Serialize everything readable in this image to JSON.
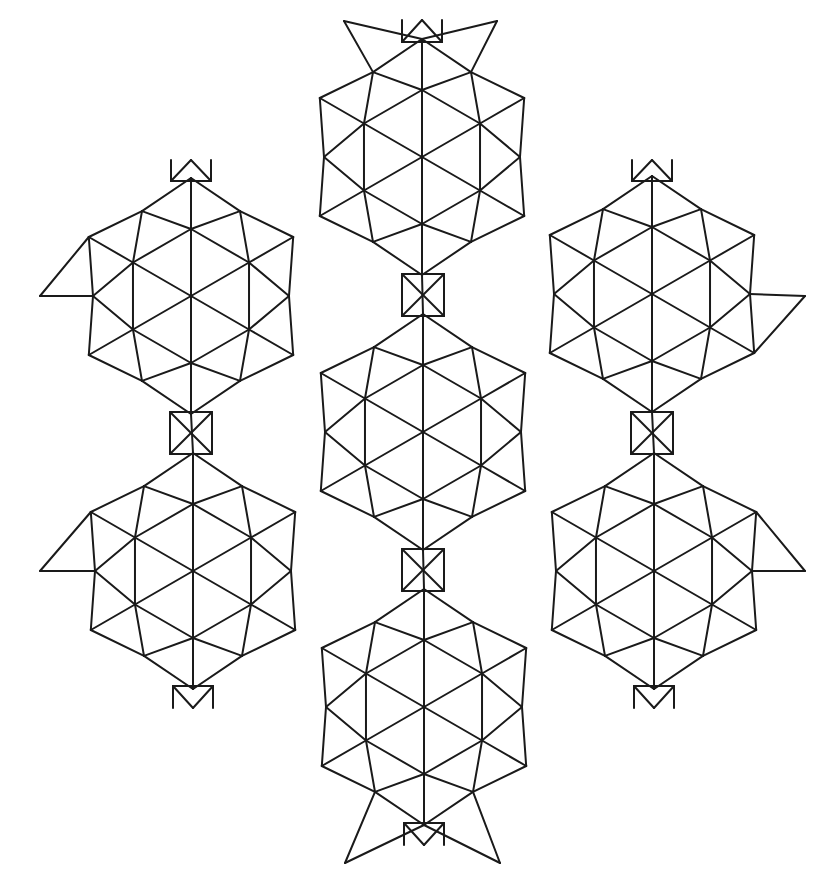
{
  "diagram": {
    "stroke_color": "#1a1a1a",
    "background": "#ffffff",
    "hex_radius": 67,
    "edge_apex_radius": 98,
    "vertex_ext_radius": 118,
    "flowers": [
      {
        "name": "top",
        "cx": 422,
        "cy": 157
      },
      {
        "name": "upper-left",
        "cx": 191,
        "cy": 296
      },
      {
        "name": "upper-right",
        "cx": 652,
        "cy": 294
      },
      {
        "name": "center",
        "cx": 423,
        "cy": 432
      },
      {
        "name": "lower-left",
        "cx": 193,
        "cy": 571
      },
      {
        "name": "lower-right",
        "cx": 654,
        "cy": 571
      },
      {
        "name": "bottom",
        "cx": 424,
        "cy": 707
      }
    ],
    "crossed_squares": [
      {
        "cx": 191,
        "cy": 433,
        "half": 21
      },
      {
        "cx": 423,
        "cy": 295,
        "half": 21
      },
      {
        "cx": 652,
        "cy": 433,
        "half": 21
      },
      {
        "cx": 423,
        "cy": 570,
        "half": 21
      }
    ],
    "outer_tips": [
      {
        "x": 40,
        "y": 296
      },
      {
        "x": 40,
        "y": 571
      },
      {
        "x": 805,
        "y": 296
      },
      {
        "x": 805,
        "y": 571
      },
      {
        "x": 344,
        "y": 21
      },
      {
        "x": 497,
        "y": 21
      },
      {
        "x": 345,
        "y": 863
      },
      {
        "x": 500,
        "y": 863
      }
    ],
    "tabs": [
      {
        "apex_x": 422,
        "apex_y": 20,
        "base_y": 42,
        "half": 20,
        "dir": "up"
      },
      {
        "apex_x": 424,
        "apex_y": 845,
        "base_y": 823,
        "half": 20,
        "dir": "down"
      },
      {
        "apex_x": 191,
        "apex_y": 160,
        "base_y": 181,
        "half": 20,
        "dir": "up"
      },
      {
        "apex_x": 652,
        "apex_y": 160,
        "base_y": 181,
        "half": 20,
        "dir": "up"
      },
      {
        "apex_x": 193,
        "apex_y": 708,
        "base_y": 686,
        "half": 20,
        "dir": "down"
      },
      {
        "apex_x": 654,
        "apex_y": 708,
        "base_y": 686,
        "half": 20,
        "dir": "down"
      }
    ]
  }
}
